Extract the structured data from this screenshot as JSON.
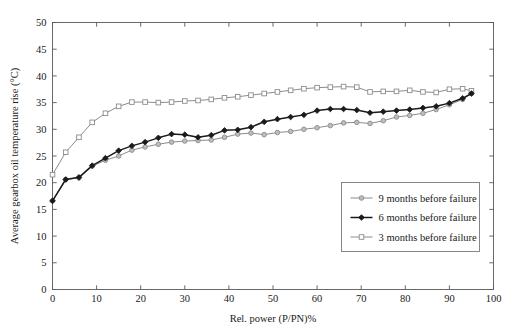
{
  "chart_data": {
    "type": "line",
    "title": "",
    "xlabel": "Rel. power (P/PN)%",
    "ylabel": "Average gearbox oil temperature rise (°C)",
    "xlim": [
      0,
      100
    ],
    "ylim": [
      0,
      50
    ],
    "xticks": [
      0,
      10,
      20,
      30,
      40,
      50,
      60,
      70,
      80,
      90,
      100
    ],
    "yticks": [
      0,
      5,
      10,
      15,
      20,
      25,
      30,
      35,
      40,
      45,
      50
    ],
    "grid": false,
    "legend_position": "lower-right",
    "series": [
      {
        "name": "9 months before failure",
        "marker": "circle-filled-gray",
        "color": "#8c8c8c",
        "x": [
          0,
          3,
          6,
          9,
          12,
          15,
          18,
          21,
          24,
          27,
          30,
          33,
          36,
          39,
          42,
          45,
          48,
          51,
          54,
          57,
          60,
          63,
          66,
          69,
          72,
          75,
          78,
          81,
          84,
          87,
          90,
          93,
          95
        ],
        "y": [
          16.6,
          20.6,
          20.9,
          23.1,
          24.2,
          25.0,
          26.1,
          26.7,
          27.2,
          27.6,
          27.8,
          27.9,
          28.0,
          28.5,
          29.1,
          29.3,
          29.0,
          29.4,
          29.6,
          30.0,
          30.3,
          30.7,
          31.2,
          31.3,
          31.1,
          31.6,
          32.3,
          32.6,
          33.0,
          33.7,
          34.6,
          35.6,
          36.7
        ]
      },
      {
        "name": "6 months before failure",
        "marker": "diamond-filled-black",
        "color": "#1a1a1a",
        "x": [
          0,
          3,
          6,
          9,
          12,
          15,
          18,
          21,
          24,
          27,
          30,
          33,
          36,
          39,
          42,
          45,
          48,
          51,
          54,
          57,
          60,
          63,
          66,
          69,
          72,
          75,
          78,
          81,
          84,
          87,
          90,
          93,
          95
        ],
        "y": [
          16.6,
          20.6,
          21.0,
          23.2,
          24.6,
          26.0,
          26.9,
          27.6,
          28.4,
          29.1,
          29.0,
          28.5,
          28.9,
          29.8,
          29.9,
          30.4,
          31.4,
          31.9,
          32.3,
          32.7,
          33.5,
          33.8,
          33.8,
          33.6,
          33.1,
          33.3,
          33.5,
          33.7,
          34.0,
          34.3,
          34.9,
          35.8,
          36.7
        ]
      },
      {
        "name": "3 months before failure",
        "marker": "square-open-gray",
        "color": "#8c8c8c",
        "x": [
          0,
          3,
          6,
          9,
          12,
          15,
          18,
          21,
          24,
          27,
          30,
          33,
          36,
          39,
          42,
          45,
          48,
          51,
          54,
          57,
          60,
          63,
          66,
          69,
          72,
          75,
          78,
          81,
          84,
          87,
          90,
          93,
          95
        ],
        "y": [
          21.5,
          25.7,
          28.5,
          31.3,
          33.0,
          34.3,
          35.1,
          35.1,
          35.0,
          35.1,
          35.3,
          35.4,
          35.6,
          35.9,
          36.1,
          36.4,
          36.7,
          37.0,
          37.3,
          37.6,
          37.8,
          37.9,
          38.0,
          37.9,
          37.0,
          37.1,
          37.1,
          37.3,
          37.0,
          36.9,
          37.5,
          37.6,
          37.2
        ]
      }
    ]
  },
  "legend": {
    "items": [
      {
        "label": "9 months before failure"
      },
      {
        "label": "6 months before failure"
      },
      {
        "label": "3 months before failure"
      }
    ]
  }
}
